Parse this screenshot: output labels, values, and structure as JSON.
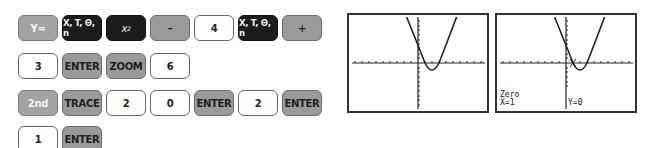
{
  "keystrokes": {
    "rows": [
      [
        {
          "label": "Y=",
          "style": "gray-light"
        },
        {
          "label": "X, T, Θ, n",
          "style": "black"
        },
        {
          "label": "x",
          "sup": "2",
          "style": "black"
        },
        {
          "label": "–",
          "style": "gray"
        },
        {
          "label": "4",
          "style": "white"
        },
        {
          "label": "X, T, Θ, n",
          "style": "black"
        },
        {
          "label": "+",
          "style": "gray"
        }
      ],
      [
        {
          "label": "3",
          "style": "white"
        },
        {
          "label": "ENTER",
          "style": "gray"
        },
        {
          "label": "ZOOM",
          "style": "gray"
        },
        {
          "label": "6",
          "style": "white"
        }
      ],
      [
        {
          "label": "2nd",
          "style": "gray-light"
        },
        {
          "label": "TRACE",
          "style": "gray"
        },
        {
          "label": "2",
          "style": "white"
        },
        {
          "label": "0",
          "style": "white"
        },
        {
          "label": "ENTER",
          "style": "gray"
        },
        {
          "label": "2",
          "style": "white"
        },
        {
          "label": "ENTER",
          "style": "gray"
        }
      ],
      [
        {
          "label": "1",
          "style": "white"
        },
        {
          "label": "ENTER",
          "style": "gray"
        }
      ]
    ]
  },
  "screens": [
    {
      "name": "graph-screen",
      "function": "y = x^2 - 4x + 3",
      "window": "ZStandard",
      "text_bottom_left": "",
      "text_bottom_right": ""
    },
    {
      "name": "zero-result-screen",
      "function": "y = x^2 - 4x + 3",
      "window": "ZStandard",
      "text_line1": "Zero",
      "text_line2": "X=1",
      "text_bottom_right": "Y=0"
    }
  ]
}
